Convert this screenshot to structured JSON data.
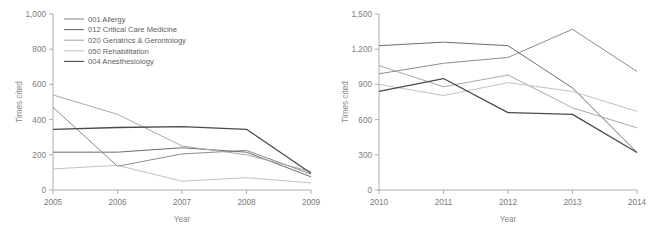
{
  "figure": {
    "background": "#ffffff",
    "text_color": "#7b7b7b"
  },
  "legend": {
    "position": "top-left-of-left-panel",
    "items": [
      {
        "label": "001 Allergy",
        "color": "#8c8c8c"
      },
      {
        "label": "012 Critical Care Medicine",
        "color": "#6e6e6e"
      },
      {
        "label": "020 Geriatrics & Gerontology",
        "color": "#a8a8a8"
      },
      {
        "label": "050 Rehabilitation",
        "color": "#c2c2c2"
      },
      {
        "label": "004 Anesthesiology",
        "color": "#4a4a4a"
      }
    ]
  },
  "chart_data": [
    {
      "id": "left-chart",
      "type": "line",
      "title": "",
      "xlabel": "Year",
      "ylabel": "Times cited",
      "x": [
        "2005",
        "2006",
        "2007",
        "2008",
        "2009"
      ],
      "xlim": [
        0,
        4
      ],
      "ylim": [
        0,
        1000
      ],
      "yticks": [
        0,
        200,
        400,
        600,
        800,
        1000
      ],
      "ytick_labels": [
        "0",
        "200",
        "400",
        "600",
        "800",
        "1,000"
      ],
      "grid": false,
      "legend_position": "upper left",
      "series": [
        {
          "name": "001 Allergy",
          "color": "#8c8c8c",
          "width": 1.0,
          "values": [
            470,
            135,
            205,
            225,
            90
          ]
        },
        {
          "name": "012 Critical Care Medicine",
          "color": "#6e6e6e",
          "width": 1.0,
          "values": [
            215,
            215,
            240,
            215,
            75
          ]
        },
        {
          "name": "020 Geriatrics & Gerontology",
          "color": "#a8a8a8",
          "width": 1.0,
          "values": [
            540,
            430,
            250,
            200,
            105
          ]
        },
        {
          "name": "050 Rehabilitation",
          "color": "#c2c2c2",
          "width": 1.0,
          "values": [
            120,
            140,
            50,
            70,
            40
          ]
        },
        {
          "name": "004 Anesthesiology",
          "color": "#4a4a4a",
          "width": 1.3,
          "values": [
            345,
            355,
            360,
            345,
            95
          ]
        }
      ]
    },
    {
      "id": "right-chart",
      "type": "line",
      "title": "",
      "xlabel": "Year",
      "ylabel": "Times cited",
      "x": [
        "2010",
        "2011",
        "2012",
        "2013",
        "2014"
      ],
      "xlim": [
        0,
        4
      ],
      "ylim": [
        0,
        1500
      ],
      "yticks": [
        0,
        300,
        600,
        900,
        1200,
        1500
      ],
      "ytick_labels": [
        "0",
        "300",
        "600",
        "900",
        "1,200",
        "1,500"
      ],
      "grid": false,
      "legend_position": "none",
      "series": [
        {
          "name": "001 Allergy",
          "color": "#8c8c8c",
          "width": 1.0,
          "values": [
            990,
            1080,
            1130,
            1370,
            1010
          ]
        },
        {
          "name": "012 Critical Care Medicine",
          "color": "#6e6e6e",
          "width": 1.0,
          "values": [
            1230,
            1260,
            1230,
            870,
            320
          ]
        },
        {
          "name": "020 Geriatrics & Gerontology",
          "color": "#a8a8a8",
          "width": 1.0,
          "values": [
            1060,
            880,
            980,
            700,
            530
          ]
        },
        {
          "name": "050 Rehabilitation",
          "color": "#c2c2c2",
          "width": 1.0,
          "values": [
            900,
            805,
            915,
            840,
            670
          ]
        },
        {
          "name": "004 Anesthesiology",
          "color": "#4a4a4a",
          "width": 1.3,
          "values": [
            840,
            950,
            660,
            645,
            320
          ]
        }
      ]
    }
  ]
}
